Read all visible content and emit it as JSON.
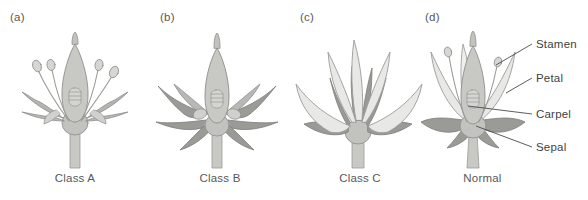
{
  "figure": {
    "background_color": "#ffffff"
  },
  "palette": {
    "petal_fill": "#e8e8e6",
    "petal_stroke": "#9b9b99",
    "sepal_fill": "#9a9a97",
    "sepal_stroke": "#7c7c79",
    "carpel_fill": "#c2c2bf",
    "carpel_stroke": "#8d8d8a",
    "stamen_fill": "#d6d6d3",
    "stamen_stroke": "#8d8d8a",
    "stem_fill": "#c8c8c5",
    "text_color": "#58585a",
    "label_color": "#3f3f41",
    "leader_line_color": "#4a4a4c"
  },
  "panels": [
    {
      "letter": "(a)",
      "caption": "Class A",
      "organs": [
        "stamen",
        "carpel",
        "sepal"
      ],
      "letter_x": 10,
      "left": 0,
      "width": 150
    },
    {
      "letter": "(b)",
      "caption": "Class B",
      "organs": [
        "sepal",
        "carpel"
      ],
      "letter_x": 10,
      "left": 150,
      "width": 140
    },
    {
      "letter": "(c)",
      "caption": "Class C",
      "organs": [
        "petal",
        "sepal"
      ],
      "letter_x": 10,
      "left": 290,
      "width": 140
    },
    {
      "letter": "(d)",
      "caption": "Normal",
      "organs": [
        "stamen",
        "petal",
        "carpel",
        "sepal"
      ],
      "letter_x": 10,
      "left": 415,
      "width": 135
    }
  ],
  "annotations": [
    {
      "label": "Stamen",
      "x": 536,
      "y": 40
    },
    {
      "label": "Petal",
      "x": 536,
      "y": 74
    },
    {
      "label": "Carpel",
      "x": 536,
      "y": 110
    },
    {
      "label": "Sepal",
      "x": 536,
      "y": 143
    }
  ]
}
